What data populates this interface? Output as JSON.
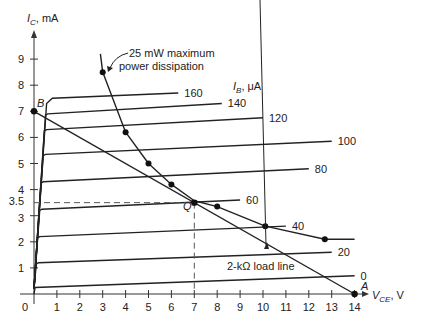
{
  "chart_data": {
    "type": "line",
    "title": "",
    "xlabel": "V_CE, V",
    "ylabel": "I_C, mA",
    "xlim": [
      0,
      14
    ],
    "ylim": [
      0,
      9.5
    ],
    "x_ticks": [
      0,
      1,
      2,
      3,
      4,
      5,
      6,
      7,
      8,
      9,
      10,
      11,
      12,
      13,
      14
    ],
    "y_ticks": [
      1,
      2,
      3,
      3.5,
      4,
      5,
      6,
      7,
      8,
      9
    ],
    "grid": false,
    "family_label": "I_B, μA",
    "series": [
      {
        "name": "I_B = 0 μA",
        "ib": 0,
        "points": [
          [
            0,
            0
          ],
          [
            0.05,
            0.25
          ],
          [
            14,
            0.7
          ]
        ],
        "label": "0"
      },
      {
        "name": "I_B = 20 μA",
        "ib": 20,
        "points": [
          [
            0,
            0.2
          ],
          [
            0.1,
            1.15
          ],
          [
            0.2,
            1.2
          ],
          [
            13,
            1.6
          ]
        ],
        "label": "20"
      },
      {
        "name": "I_B = 40 μA",
        "ib": 40,
        "points": [
          [
            0,
            0.2
          ],
          [
            0.15,
            2.15
          ],
          [
            0.25,
            2.2
          ],
          [
            11,
            2.6
          ]
        ],
        "label": "40"
      },
      {
        "name": "I_B = 60 μA",
        "ib": 60,
        "points": [
          [
            0,
            0.2
          ],
          [
            0.25,
            3.2
          ],
          [
            0.35,
            3.25
          ],
          [
            9,
            3.6
          ]
        ],
        "label": "60"
      },
      {
        "name": "I_B = 80 μA",
        "ib": 80,
        "points": [
          [
            0,
            0.2
          ],
          [
            0.3,
            4.25
          ],
          [
            0.4,
            4.3
          ],
          [
            12,
            4.8
          ]
        ],
        "label": "80"
      },
      {
        "name": "I_B = 100 μA",
        "ib": 100,
        "points": [
          [
            0,
            0.2
          ],
          [
            0.4,
            5.3
          ],
          [
            0.5,
            5.35
          ],
          [
            13,
            5.85
          ]
        ],
        "label": "100"
      },
      {
        "name": "I_B = 120 μA",
        "ib": 120,
        "points": [
          [
            0,
            0.2
          ],
          [
            0.45,
            6.25
          ],
          [
            0.55,
            6.3
          ],
          [
            10,
            6.75
          ]
        ],
        "label": "120"
      },
      {
        "name": "I_B = 140 μA",
        "ib": 140,
        "points": [
          [
            0,
            0.2
          ],
          [
            0.5,
            6.85
          ],
          [
            0.6,
            6.9
          ],
          [
            8.2,
            7.3
          ]
        ],
        "label": "140"
      },
      {
        "name": "I_B = 160 μA",
        "ib": 160,
        "points": [
          [
            0,
            0.2
          ],
          [
            0.55,
            7.3
          ],
          [
            0.8,
            7.5
          ],
          [
            6.3,
            7.7
          ]
        ],
        "label": "160"
      }
    ],
    "power_curve": {
      "name": "25 mW maximum power dissipation",
      "points": [
        [
          2.9,
          9.2
        ],
        [
          3.0,
          8.5
        ],
        [
          4.0,
          6.2
        ],
        [
          5.0,
          5.0
        ],
        [
          6.0,
          4.2
        ],
        [
          7.0,
          3.57
        ],
        [
          8.0,
          3.35
        ],
        [
          10.1,
          2.6
        ],
        [
          12.7,
          2.1
        ],
        [
          14.0,
          2.1
        ]
      ],
      "markers": [
        [
          3.0,
          8.5
        ],
        [
          4.0,
          6.2
        ],
        [
          5.0,
          5.0
        ],
        [
          6.0,
          4.2
        ],
        [
          8.0,
          3.35
        ],
        [
          10.1,
          2.6
        ],
        [
          12.7,
          2.1
        ]
      ]
    },
    "load_line": {
      "name": "2-kΩ load line",
      "points": [
        [
          0,
          7
        ],
        [
          14,
          0
        ]
      ],
      "endpoints": {
        "B": [
          0,
          7
        ],
        "A": [
          14,
          0
        ]
      }
    },
    "q_point": {
      "label": "Q",
      "vce": 7,
      "ic": 3.5
    },
    "annotations": [
      {
        "text": "25 mW maximum power dissipation",
        "target": "power_curve"
      },
      {
        "text": "2-kΩ load line",
        "target": "load_line"
      },
      {
        "text": "B",
        "at": [
          0,
          7
        ]
      },
      {
        "text": "A",
        "at": [
          14,
          0
        ]
      },
      {
        "text": "Q",
        "at": [
          7,
          3.5
        ]
      }
    ]
  },
  "labels": {
    "y_axis_main": "I",
    "y_axis_sub": "C",
    "y_axis_unit": ", mA",
    "x_axis_main": "V",
    "x_axis_sub": "CE",
    "x_axis_unit": ", V",
    "ib_main": "I",
    "ib_sub": "B",
    "ib_unit": ", μA",
    "power_line1": "25 mW maximum",
    "power_line2": "power dissipation",
    "load_line": "2-kΩ load line",
    "point_a": "A",
    "point_b": "B",
    "point_q": "Q",
    "y_35": "3.5"
  }
}
